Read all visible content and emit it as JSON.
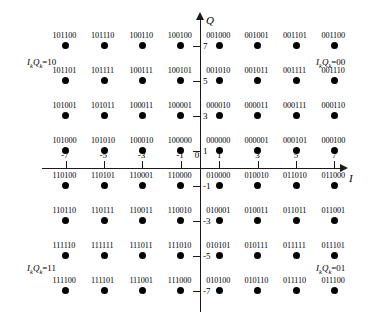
{
  "chart_data": {
    "type": "scatter",
    "title": "",
    "xlabel": "I",
    "ylabel": "Q",
    "xlim": [
      -8,
      8
    ],
    "ylim": [
      -8,
      8
    ],
    "grid": false,
    "legend": "none",
    "x_ticks": [
      -7,
      -5,
      -3,
      -1,
      0,
      1,
      3,
      5,
      7
    ],
    "x_tick_labels": [
      "-7",
      "-5",
      "-3",
      "-1",
      "0",
      "1",
      "3",
      "5",
      "7"
    ],
    "y_ticks": [
      7,
      5,
      3,
      1,
      -1,
      -3,
      -5,
      -7
    ],
    "y_tick_labels": [
      "7",
      "5",
      "3",
      "1",
      "-1",
      "-3",
      "-5",
      "-7"
    ],
    "annotations": [
      {
        "text": "IkQk=10",
        "quadrant": "top-left"
      },
      {
        "text": "IkQk=00",
        "quadrant": "top-right"
      },
      {
        "text": "IkQk=11",
        "quadrant": "bottom-left"
      },
      {
        "text": "IkQk=01",
        "quadrant": "bottom-right"
      }
    ],
    "points": [
      {
        "x": -7,
        "y": 7,
        "label": "101100"
      },
      {
        "x": -5,
        "y": 7,
        "label": "101110"
      },
      {
        "x": -3,
        "y": 7,
        "label": "100110"
      },
      {
        "x": -1,
        "y": 7,
        "label": "100100"
      },
      {
        "x": 1,
        "y": 7,
        "label": "001000"
      },
      {
        "x": 3,
        "y": 7,
        "label": "001001"
      },
      {
        "x": 5,
        "y": 7,
        "label": "001101"
      },
      {
        "x": 7,
        "y": 7,
        "label": "001100"
      },
      {
        "x": -7,
        "y": 5,
        "label": "101101"
      },
      {
        "x": -5,
        "y": 5,
        "label": "101111"
      },
      {
        "x": -3,
        "y": 5,
        "label": "100111"
      },
      {
        "x": -1,
        "y": 5,
        "label": "100101"
      },
      {
        "x": 1,
        "y": 5,
        "label": "001010"
      },
      {
        "x": 3,
        "y": 5,
        "label": "001011"
      },
      {
        "x": 5,
        "y": 5,
        "label": "001111"
      },
      {
        "x": 7,
        "y": 5,
        "label": "001110"
      },
      {
        "x": -7,
        "y": 3,
        "label": "101001"
      },
      {
        "x": -5,
        "y": 3,
        "label": "101011"
      },
      {
        "x": -3,
        "y": 3,
        "label": "100011"
      },
      {
        "x": -1,
        "y": 3,
        "label": "100001"
      },
      {
        "x": 1,
        "y": 3,
        "label": "000010"
      },
      {
        "x": 3,
        "y": 3,
        "label": "000011"
      },
      {
        "x": 5,
        "y": 3,
        "label": "000111"
      },
      {
        "x": 7,
        "y": 3,
        "label": "000110"
      },
      {
        "x": -7,
        "y": 1,
        "label": "101000"
      },
      {
        "x": -5,
        "y": 1,
        "label": "101010"
      },
      {
        "x": -3,
        "y": 1,
        "label": "100010"
      },
      {
        "x": -1,
        "y": 1,
        "label": "100000"
      },
      {
        "x": 1,
        "y": 1,
        "label": "000000"
      },
      {
        "x": 3,
        "y": 1,
        "label": "000001"
      },
      {
        "x": 5,
        "y": 1,
        "label": "000101"
      },
      {
        "x": 7,
        "y": 1,
        "label": "000100"
      },
      {
        "x": -7,
        "y": -1,
        "label": "110100"
      },
      {
        "x": -5,
        "y": -1,
        "label": "110101"
      },
      {
        "x": -3,
        "y": -1,
        "label": "110001"
      },
      {
        "x": -1,
        "y": -1,
        "label": "110000"
      },
      {
        "x": 1,
        "y": -1,
        "label": "010000"
      },
      {
        "x": 3,
        "y": -1,
        "label": "010010"
      },
      {
        "x": 5,
        "y": -1,
        "label": "011010"
      },
      {
        "x": 7,
        "y": -1,
        "label": "011000"
      },
      {
        "x": -7,
        "y": -3,
        "label": "110110"
      },
      {
        "x": -5,
        "y": -3,
        "label": "110111"
      },
      {
        "x": -3,
        "y": -3,
        "label": "110011"
      },
      {
        "x": -1,
        "y": -3,
        "label": "110010"
      },
      {
        "x": 1,
        "y": -3,
        "label": "010001"
      },
      {
        "x": 3,
        "y": -3,
        "label": "010011"
      },
      {
        "x": 5,
        "y": -3,
        "label": "011011"
      },
      {
        "x": 7,
        "y": -3,
        "label": "011001"
      },
      {
        "x": -7,
        "y": -5,
        "label": "111110"
      },
      {
        "x": -5,
        "y": -5,
        "label": "111111"
      },
      {
        "x": -3,
        "y": -5,
        "label": "111011"
      },
      {
        "x": -1,
        "y": -5,
        "label": "111010"
      },
      {
        "x": 1,
        "y": -5,
        "label": "010101"
      },
      {
        "x": 3,
        "y": -5,
        "label": "010111"
      },
      {
        "x": 5,
        "y": -5,
        "label": "011111"
      },
      {
        "x": 7,
        "y": -5,
        "label": "011101"
      },
      {
        "x": -7,
        "y": -7,
        "label": "111100"
      },
      {
        "x": -5,
        "y": -7,
        "label": "111101"
      },
      {
        "x": -3,
        "y": -7,
        "label": "111001"
      },
      {
        "x": -1,
        "y": -7,
        "label": "111000"
      },
      {
        "x": 1,
        "y": -7,
        "label": "010100"
      },
      {
        "x": 3,
        "y": -7,
        "label": "010110"
      },
      {
        "x": 5,
        "y": -7,
        "label": "011110"
      },
      {
        "x": 7,
        "y": -7,
        "label": "011100"
      }
    ]
  },
  "axes": {
    "q_label": "Q",
    "i_label": "I"
  },
  "quadrant_labels": {
    "top_left": {
      "prefix": "I",
      "sub1": "k",
      "mid": "Q",
      "sub2": "k",
      "eq": "=10"
    },
    "top_right": {
      "prefix": "I",
      "sub1": "k",
      "mid": "Q",
      "sub2": "k",
      "eq": "=00"
    },
    "bottom_left": {
      "prefix": "I",
      "sub1": "k",
      "mid": "Q",
      "sub2": "k",
      "eq": "=11"
    },
    "bottom_right": {
      "prefix": "I",
      "sub1": "k",
      "mid": "Q",
      "sub2": "k",
      "eq": "=01"
    }
  }
}
